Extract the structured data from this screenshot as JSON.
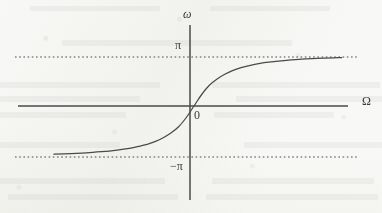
{
  "figure": {
    "kind": "phase-response-plot",
    "background_color": "#f8f8f6",
    "ink_color": "#4a4a4a",
    "labels": {
      "y_axis": "ω",
      "x_axis": "Ω",
      "origin": "0",
      "upper_asymptote": "π",
      "lower_asymptote": "−π"
    }
  },
  "chart_data": {
    "type": "line",
    "title": "",
    "xlabel": "Ω",
    "ylabel": "ω",
    "grid": false,
    "legend": null,
    "annotations": [
      {
        "text": "π",
        "x": 0,
        "y": 3.1416,
        "placement": "left-of-y-axis"
      },
      {
        "text": "−π",
        "x": 0,
        "y": -3.1416,
        "placement": "left-of-y-axis"
      },
      {
        "text": "0",
        "x": 0,
        "y": 0,
        "placement": "right-of-origin-below-axis"
      },
      {
        "text": "ω",
        "x": 0,
        "y": 4.2,
        "placement": "top-of-y-axis"
      },
      {
        "text": "Ω",
        "x": 10.5,
        "y": 0.35,
        "placement": "right-of-x-axis"
      }
    ],
    "xlim": [
      -10.0,
      10.0
    ],
    "ylim": [
      -4.2,
      4.2
    ],
    "yticks": [
      -3.1416,
      0,
      3.1416
    ],
    "ytick_labels": [
      "−π",
      "0",
      "π"
    ],
    "xticks": [
      0
    ],
    "xtick_labels": [
      "0"
    ],
    "asymptotes": [
      {
        "value": 3.1416,
        "label": "π",
        "style": "dotted"
      },
      {
        "value": -3.1416,
        "label": "−π",
        "style": "dotted"
      }
    ],
    "series": [
      {
        "name": "phase",
        "style": "solid",
        "x": [
          -9.1,
          -8.0,
          -7.0,
          -6.0,
          -5.0,
          -4.2,
          -3.5,
          -3.0,
          -2.5,
          -2.0,
          -1.5,
          -1.0,
          -0.5,
          0.0,
          0.5,
          1.0,
          1.5,
          2.0,
          2.5,
          3.0,
          3.5,
          4.2,
          5.0,
          6.0,
          7.0,
          8.0,
          9.1,
          9.6
        ],
        "y": [
          -3.09,
          -3.05,
          -3.0,
          -2.93,
          -2.83,
          -2.72,
          -2.57,
          -2.44,
          -2.27,
          -2.03,
          -1.73,
          -1.33,
          -0.74,
          0.0,
          0.74,
          1.33,
          1.73,
          2.03,
          2.27,
          2.44,
          2.57,
          2.72,
          2.83,
          2.93,
          3.0,
          3.05,
          3.09,
          3.1
        ]
      }
    ]
  },
  "geometry": {
    "origin_px": {
      "x": 190,
      "y": 106
    },
    "y_axis_px": {
      "x": 190,
      "y_top": 25,
      "y_bottom": 200
    },
    "x_axis_px": {
      "y": 106,
      "x_left": 18,
      "x_right": 348
    },
    "asymptote_upper_px": {
      "y": 57,
      "x_left": 15,
      "x_right": 358
    },
    "asymptote_lower_px": {
      "y": 157,
      "x_left": 15,
      "x_right": 358
    },
    "curve_px": "M 40,157 C 70,155 95,152 118,145 C 142,138 163,126 190,106 C 217,86 240,73 266,66 C 292,59 322,58 348,57"
  }
}
